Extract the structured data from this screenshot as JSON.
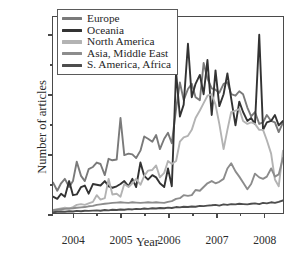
{
  "chart_data": {
    "type": "line",
    "title": "",
    "xlabel": "Year",
    "ylabel": "Number of articles",
    "xlim": [
      2003.58,
      2008.42
    ],
    "ylim": [
      0,
      1320
    ],
    "yticks": [
      0,
      400,
      800,
      1200
    ],
    "ytick_labels": [
      "0",
      "400",
      "800",
      "1200"
    ],
    "yticks_minor": [
      200,
      600,
      1000
    ],
    "xticks": [
      2004,
      2005,
      2006,
      2007,
      2008
    ],
    "xtick_labels": [
      "2004",
      "2005",
      "2006",
      "2007",
      "2008"
    ],
    "xticks_minor": [
      2004.5,
      2005.5,
      2006.5,
      2007.5
    ],
    "grid": false,
    "legend_position": "upper left",
    "series": [
      {
        "name": "Europe",
        "color": "#7a7a7a",
        "x": [
          2003.58,
          2003.67,
          2003.75,
          2003.83,
          2003.92,
          2004.0,
          2004.08,
          2004.17,
          2004.25,
          2004.33,
          2004.42,
          2004.5,
          2004.58,
          2004.67,
          2004.75,
          2004.83,
          2004.92,
          2005.0,
          2005.08,
          2005.17,
          2005.25,
          2005.33,
          2005.42,
          2005.5,
          2005.58,
          2005.67,
          2005.75,
          2005.83,
          2005.92,
          2006.0,
          2006.08,
          2006.17,
          2006.25,
          2006.33,
          2006.42,
          2006.5,
          2006.58,
          2006.67,
          2006.75,
          2006.83,
          2006.92,
          2007.0,
          2007.08,
          2007.17,
          2007.25,
          2007.33,
          2007.42,
          2007.5,
          2007.58,
          2007.67,
          2007.75,
          2007.83,
          2007.92,
          2008.0,
          2008.08,
          2008.17,
          2008.25,
          2008.33,
          2008.42
        ],
        "y": [
          205,
          150,
          200,
          230,
          175,
          215,
          345,
          250,
          215,
          295,
          310,
          340,
          330,
          255,
          365,
          355,
          360,
          640,
          390,
          400,
          395,
          370,
          420,
          515,
          500,
          480,
          525,
          430,
          500,
          540,
          470,
          700,
          880,
          760,
          835,
          870,
          780,
          760,
          1010,
          905,
          840,
          830,
          810,
          870,
          880,
          800,
          790,
          820,
          800,
          710,
          650,
          680,
          600,
          610,
          660,
          620,
          610,
          545,
          610
        ]
      },
      {
        "name": "Oceania",
        "color": "#333333",
        "x": [
          2003.58,
          2003.67,
          2003.75,
          2003.83,
          2003.92,
          2004.0,
          2004.08,
          2004.17,
          2004.25,
          2004.33,
          2004.42,
          2004.5,
          2004.58,
          2004.67,
          2004.75,
          2004.83,
          2004.92,
          2005.0,
          2005.08,
          2005.17,
          2005.25,
          2005.33,
          2005.42,
          2005.5,
          2005.58,
          2005.67,
          2005.75,
          2005.83,
          2005.92,
          2006.0,
          2006.08,
          2006.17,
          2006.25,
          2006.33,
          2006.42,
          2006.5,
          2006.58,
          2006.67,
          2006.75,
          2006.83,
          2006.92,
          2007.0,
          2007.08,
          2007.17,
          2007.25,
          2007.33,
          2007.42,
          2007.5,
          2007.58,
          2007.67,
          2007.75,
          2007.83,
          2007.92,
          2008.0,
          2008.08,
          2008.17,
          2008.25,
          2008.33,
          2008.42
        ],
        "y": [
          110,
          95,
          130,
          110,
          215,
          120,
          125,
          175,
          185,
          130,
          195,
          190,
          185,
          215,
          180,
          170,
          180,
          195,
          215,
          180,
          230,
          175,
          340,
          250,
          225,
          255,
          240,
          200,
          175,
          300,
          180,
          950,
          650,
          730,
          1140,
          780,
          870,
          930,
          800,
          1030,
          660,
          960,
          720,
          800,
          940,
          770,
          590,
          750,
          680,
          620,
          640,
          600,
          1200,
          560,
          610,
          620,
          660,
          590,
          620
        ]
      },
      {
        "name": "North America",
        "color": "#b3b3b3",
        "x": [
          2003.58,
          2003.67,
          2003.75,
          2003.83,
          2003.92,
          2004.0,
          2004.08,
          2004.17,
          2004.25,
          2004.33,
          2004.42,
          2004.5,
          2004.58,
          2004.67,
          2004.75,
          2004.83,
          2004.92,
          2005.0,
          2005.08,
          2005.17,
          2005.25,
          2005.33,
          2005.42,
          2005.5,
          2005.58,
          2005.67,
          2005.75,
          2005.83,
          2005.92,
          2006.0,
          2006.08,
          2006.17,
          2006.25,
          2006.33,
          2006.42,
          2006.5,
          2006.58,
          2006.67,
          2006.75,
          2006.83,
          2006.92,
          2007.0,
          2007.08,
          2007.17,
          2007.25,
          2007.33,
          2007.42,
          2007.5,
          2007.58,
          2007.67,
          2007.75,
          2007.83,
          2007.92,
          2008.0,
          2008.08,
          2008.17,
          2008.25,
          2008.33,
          2008.42
        ],
        "y": [
          20,
          25,
          30,
          35,
          30,
          40,
          55,
          60,
          55,
          65,
          75,
          120,
          90,
          100,
          230,
          125,
          130,
          110,
          195,
          175,
          200,
          230,
          190,
          250,
          285,
          290,
          320,
          240,
          270,
          350,
          330,
          350,
          480,
          510,
          520,
          560,
          640,
          690,
          740,
          790,
          800,
          730,
          600,
          430,
          560,
          680,
          690,
          700,
          620,
          600,
          610,
          600,
          560,
          560,
          490,
          400,
          225,
          180,
          420
        ]
      },
      {
        "name": "Asia, Middle East",
        "color": "#8c8c8c",
        "x": [
          2003.58,
          2003.67,
          2003.75,
          2003.83,
          2003.92,
          2004.0,
          2004.08,
          2004.17,
          2004.25,
          2004.33,
          2004.42,
          2004.5,
          2004.58,
          2004.67,
          2004.75,
          2004.83,
          2004.92,
          2005.0,
          2005.08,
          2005.17,
          2005.25,
          2005.33,
          2005.42,
          2005.5,
          2005.58,
          2005.67,
          2005.75,
          2005.83,
          2005.92,
          2006.0,
          2006.08,
          2006.17,
          2006.25,
          2006.33,
          2006.42,
          2006.5,
          2006.58,
          2006.67,
          2006.75,
          2006.83,
          2006.92,
          2007.0,
          2007.08,
          2007.17,
          2007.25,
          2007.33,
          2007.42,
          2007.5,
          2007.58,
          2007.67,
          2007.75,
          2007.83,
          2007.92,
          2008.0,
          2008.08,
          2008.17,
          2008.25,
          2008.33,
          2008.42
        ],
        "y": [
          18,
          22,
          25,
          28,
          30,
          32,
          35,
          38,
          40,
          45,
          48,
          55,
          58,
          62,
          65,
          68,
          70,
          72,
          70,
          68,
          72,
          70,
          68,
          70,
          72,
          70,
          72,
          70,
          68,
          75,
          80,
          95,
          100,
          120,
          115,
          120,
          155,
          150,
          175,
          200,
          215,
          200,
          210,
          230,
          300,
          335,
          280,
          245,
          205,
          160,
          195,
          265,
          240,
          230,
          245,
          300,
          245,
          260,
          370
        ]
      },
      {
        "name": "S. America, Africa",
        "color": "#4d4d4d",
        "x": [
          2003.58,
          2003.67,
          2003.75,
          2003.83,
          2003.92,
          2004.0,
          2004.08,
          2004.17,
          2004.25,
          2004.33,
          2004.42,
          2004.5,
          2004.58,
          2004.67,
          2004.75,
          2004.83,
          2004.92,
          2005.0,
          2005.08,
          2005.17,
          2005.25,
          2005.33,
          2005.42,
          2005.5,
          2005.58,
          2005.67,
          2005.75,
          2005.83,
          2005.92,
          2006.0,
          2006.08,
          2006.17,
          2006.25,
          2006.33,
          2006.42,
          2006.5,
          2006.58,
          2006.67,
          2006.75,
          2006.83,
          2006.92,
          2007.0,
          2007.08,
          2007.17,
          2007.25,
          2007.33,
          2007.42,
          2007.5,
          2007.58,
          2007.67,
          2007.75,
          2007.83,
          2007.92,
          2008.0,
          2008.08,
          2008.17,
          2008.25,
          2008.33,
          2008.42
        ],
        "y": [
          5,
          8,
          10,
          8,
          12,
          10,
          14,
          12,
          15,
          14,
          16,
          18,
          15,
          20,
          18,
          22,
          20,
          24,
          22,
          26,
          24,
          28,
          26,
          30,
          28,
          32,
          30,
          34,
          32,
          36,
          34,
          40,
          38,
          42,
          40,
          44,
          42,
          48,
          46,
          50,
          52,
          55,
          50,
          58,
          55,
          60,
          58,
          62,
          60,
          58,
          62,
          65,
          60,
          68,
          65,
          72,
          68,
          75,
          85
        ]
      }
    ]
  },
  "axis": {
    "ylabel_title": "Number of articles",
    "xlabel_title": "Year"
  },
  "legend": {
    "items": [
      {
        "label": "Europe"
      },
      {
        "label": "Oceania"
      },
      {
        "label": "North America"
      },
      {
        "label": "Asia, Middle East"
      },
      {
        "label": "S. America, Africa"
      }
    ]
  }
}
